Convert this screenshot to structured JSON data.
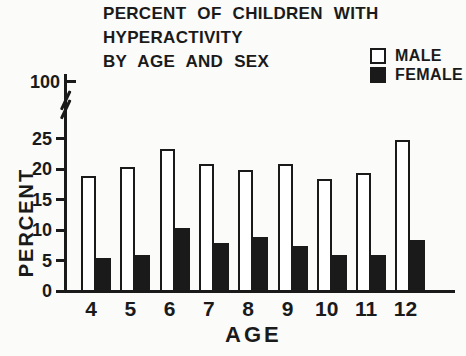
{
  "title": {
    "lines": [
      "PERCENT OF CHILDREN WITH",
      "HYPERACTIVITY",
      "BY AGE AND SEX"
    ]
  },
  "legend": {
    "items": [
      {
        "label": "MALE",
        "swatch": "open-square"
      },
      {
        "label": "FEMALE",
        "swatch": "filled-square"
      }
    ]
  },
  "y_axis": {
    "title": "PERCENT",
    "top_tick_label": "100",
    "has_break": true,
    "tick_labels": [
      "25",
      "20",
      "15",
      "10",
      "5",
      "0"
    ]
  },
  "x_axis": {
    "title": "AGE",
    "tick_labels": [
      "4",
      "5",
      "6",
      "7",
      "8",
      "9",
      "10",
      "11",
      "12"
    ]
  },
  "colors": {
    "ink": "#1a1a1a",
    "background": "#fbfbf9",
    "male_fill": "#ffffff",
    "female_fill": "#1a1a1a"
  },
  "chart_data": {
    "type": "bar",
    "title": "PERCENT OF CHILDREN WITH HYPERACTIVITY BY AGE AND SEX",
    "xlabel": "AGE",
    "ylabel": "PERCENT",
    "categories": [
      "4",
      "5",
      "6",
      "7",
      "8",
      "9",
      "10",
      "11",
      "12"
    ],
    "series": [
      {
        "name": "MALE",
        "style": "open-bar",
        "values": [
          19,
          20.5,
          23.5,
          21,
          20,
          21,
          18.5,
          19.5,
          25
        ]
      },
      {
        "name": "FEMALE",
        "style": "solid-bar",
        "values": [
          5.5,
          6,
          10.5,
          8,
          9,
          7.5,
          6,
          6,
          8.5
        ]
      }
    ],
    "ylim": [
      0,
      25
    ],
    "y_axis_break_upper_value": 100,
    "grid": false,
    "legend_position": "top-right"
  }
}
